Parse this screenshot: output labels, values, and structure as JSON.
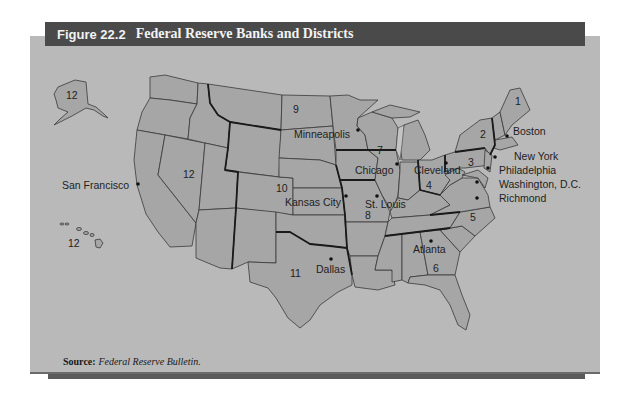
{
  "figure": {
    "number": "Figure 22.2",
    "title": "Federal Reserve Banks and Districts"
  },
  "source": {
    "label": "Source:",
    "text": "Federal Reserve Bulletin."
  },
  "colors": {
    "title_bar": "#4a4a4a",
    "panel": "#b9b9b9",
    "land": "#a6a6a6",
    "border": "#3a3a3a"
  },
  "districts": [
    {
      "number": "1",
      "bank_city": "Boston"
    },
    {
      "number": "2",
      "bank_city": "New York"
    },
    {
      "number": "3",
      "bank_city": "Philadelphia"
    },
    {
      "number": "4",
      "bank_city": "Cleveland"
    },
    {
      "number": "5",
      "bank_city": "Richmond"
    },
    {
      "number": "6",
      "bank_city": "Atlanta"
    },
    {
      "number": "7",
      "bank_city": "Chicago"
    },
    {
      "number": "8",
      "bank_city": "St. Louis"
    },
    {
      "number": "9",
      "bank_city": "Minneapolis"
    },
    {
      "number": "10",
      "bank_city": "Kansas City"
    },
    {
      "number": "11",
      "bank_city": "Dallas"
    },
    {
      "number": "12",
      "bank_city": "San Francisco"
    }
  ],
  "extra_labels": {
    "washington": "Washington, D.C.",
    "alaska_district": "12",
    "hawaii_district": "12",
    "west_district": "12"
  }
}
